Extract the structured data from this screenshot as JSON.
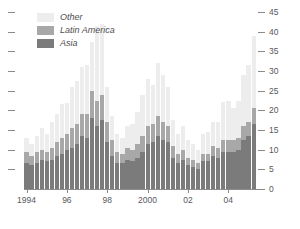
{
  "chart_data": {
    "type": "bar",
    "subtype": "stacked-vertical",
    "title": "",
    "subtitle": "",
    "xlabel": "",
    "ylabel": "",
    "ylim": [
      0,
      45
    ],
    "yticks": [
      0,
      5,
      10,
      15,
      20,
      25,
      30,
      35,
      40,
      45
    ],
    "ytick_labels": [
      "0",
      "5",
      "10",
      "15",
      "20",
      "25",
      "30",
      "35",
      "40",
      "45"
    ],
    "y_axis_position": "right",
    "left_axis_ticks_unlabeled": true,
    "grid": false,
    "legend_position": "top-left",
    "x_tick_labels": [
      "1994",
      "96",
      "98",
      "2000",
      "02",
      "04"
    ],
    "x_tick_categories": [
      "1994Q1",
      "1996Q1",
      "1998Q1",
      "2000Q1",
      "2002Q1",
      "2004Q1"
    ],
    "categories": [
      "1994Q1",
      "1994Q2",
      "1994Q3",
      "1994Q4",
      "1995Q1",
      "1995Q2",
      "1995Q3",
      "1995Q4",
      "1996Q1",
      "1996Q2",
      "1996Q3",
      "1996Q4",
      "1997Q1",
      "1997Q2",
      "1997Q3",
      "1997Q4",
      "1998Q1",
      "1998Q2",
      "1998Q3",
      "1998Q4",
      "1999Q1",
      "1999Q2",
      "1999Q3",
      "1999Q4",
      "2000Q1",
      "2000Q2",
      "2000Q3",
      "2000Q4",
      "2001Q1",
      "2001Q2",
      "2001Q3",
      "2001Q4",
      "2002Q1",
      "2002Q2",
      "2002Q3",
      "2002Q4",
      "2003Q1",
      "2003Q2",
      "2003Q3",
      "2003Q4",
      "2004Q1",
      "2004Q2",
      "2004Q3",
      "2004Q4",
      "2005Q1",
      "2005Q2"
    ],
    "series": [
      {
        "name": "Asia",
        "color": "#7b7b7b",
        "values": [
          6.5,
          6.0,
          6.5,
          7.5,
          7.0,
          7.5,
          8.5,
          9.0,
          10.0,
          10.5,
          11.5,
          13.5,
          13.0,
          18.0,
          16.0,
          17.5,
          12.0,
          8.5,
          6.5,
          6.5,
          7.5,
          7.0,
          8.0,
          9.5,
          11.5,
          12.0,
          13.5,
          12.5,
          12.0,
          8.0,
          6.5,
          7.5,
          6.0,
          5.5,
          5.0,
          7.0,
          7.0,
          8.5,
          8.0,
          9.5,
          9.5,
          9.5,
          10.0,
          12.5,
          13.5,
          16.5
        ]
      },
      {
        "name": "Latin America",
        "color": "#a8a8a8",
        "values": [
          3.0,
          2.5,
          3.0,
          2.5,
          2.5,
          3.0,
          3.5,
          4.0,
          4.0,
          5.0,
          5.0,
          5.5,
          6.0,
          7.0,
          6.5,
          6.5,
          5.0,
          4.0,
          3.0,
          2.5,
          3.0,
          3.0,
          3.5,
          4.0,
          4.5,
          4.5,
          5.0,
          4.5,
          4.0,
          3.0,
          2.5,
          2.5,
          2.0,
          2.0,
          1.5,
          2.0,
          2.0,
          2.5,
          2.5,
          3.0,
          3.0,
          3.0,
          3.0,
          3.5,
          3.5,
          4.0
        ]
      },
      {
        "name": "Other",
        "color": "#ededed",
        "values": [
          3.5,
          3.0,
          4.0,
          5.5,
          4.5,
          6.5,
          7.0,
          8.5,
          8.0,
          10.5,
          11.0,
          12.0,
          12.5,
          12.5,
          19.0,
          18.0,
          9.0,
          6.0,
          4.5,
          4.0,
          5.5,
          6.5,
          8.0,
          10.5,
          12.0,
          10.0,
          13.5,
          12.0,
          10.0,
          6.5,
          5.0,
          6.0,
          4.5,
          4.0,
          3.5,
          5.0,
          5.5,
          6.0,
          6.5,
          9.5,
          10.0,
          8.0,
          9.5,
          13.0,
          14.5,
          18.5
        ]
      }
    ]
  },
  "legend": {
    "items": [
      {
        "label": "Other",
        "color": "#ededed"
      },
      {
        "label": "Latin America",
        "color": "#a8a8a8"
      },
      {
        "label": "Asia",
        "color": "#7b7b7b"
      }
    ]
  },
  "colors": {
    "other": "#ededed",
    "latin_america": "#a8a8a8",
    "asia": "#7b7b7b",
    "axis": "#8a8a8a",
    "text": "#58585a",
    "background": "#ffffff"
  }
}
